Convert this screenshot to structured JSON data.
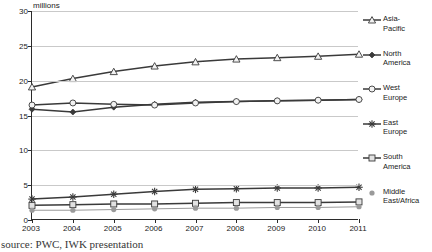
{
  "chart_data": {
    "type": "line",
    "title": "",
    "subtitle": "",
    "xlabel": "",
    "ylabel": "millions",
    "units_label": "millions",
    "categories": [
      "2003",
      "2004",
      "2005",
      "2006",
      "2007",
      "2008",
      "2009",
      "2010",
      "2011"
    ],
    "x": [
      2003,
      2004,
      2005,
      2006,
      2007,
      2008,
      2009,
      2010,
      2011
    ],
    "ylim": [
      0,
      30
    ],
    "yticks": [
      0,
      5,
      10,
      15,
      20,
      25,
      30
    ],
    "grid": true,
    "legend_position": "right",
    "series": [
      {
        "name": "Asia-Pacific",
        "label": "Asia-\nPacific",
        "marker": "triangle",
        "color": "#3a3a3a",
        "values": [
          19.1,
          20.3,
          21.3,
          22.1,
          22.7,
          23.1,
          23.3,
          23.5,
          23.8
        ]
      },
      {
        "name": "North America",
        "label": "North\nAmerica",
        "marker": "diamond",
        "color": "#3a3a3a",
        "values": [
          15.9,
          15.5,
          16.2,
          16.6,
          16.9,
          17.0,
          17.1,
          17.2,
          17.3
        ]
      },
      {
        "name": "West Europe",
        "label": "West\nEurope",
        "marker": "circle",
        "color": "#3a3a3a",
        "values": [
          16.5,
          16.8,
          16.6,
          16.5,
          16.8,
          17.0,
          17.1,
          17.2,
          17.3
        ]
      },
      {
        "name": "East Europe",
        "label": "East\nEurope",
        "marker": "star",
        "color": "#3a3a3a",
        "values": [
          3.0,
          3.3,
          3.7,
          4.1,
          4.4,
          4.5,
          4.6,
          4.6,
          4.7
        ]
      },
      {
        "name": "South America",
        "label": "South\nAmerica",
        "marker": "square",
        "color": "#3a3a3a",
        "values": [
          2.1,
          2.2,
          2.3,
          2.3,
          2.4,
          2.5,
          2.5,
          2.5,
          2.6
        ]
      },
      {
        "name": "Middle East/Africa",
        "label": "Middle\nEast/Africa",
        "marker": "dot",
        "color": "#9a9a9a",
        "values": [
          1.4,
          1.4,
          1.5,
          1.6,
          1.7,
          1.7,
          1.8,
          1.8,
          1.9
        ]
      }
    ]
  },
  "source_note": "source: PWC, IWK presentation",
  "colors": {
    "axis": "#2b2b2b",
    "grid": "#c9c9c9",
    "series_dark": "#3a3a3a",
    "series_light": "#9a9a9a",
    "background": "#ffffff"
  }
}
